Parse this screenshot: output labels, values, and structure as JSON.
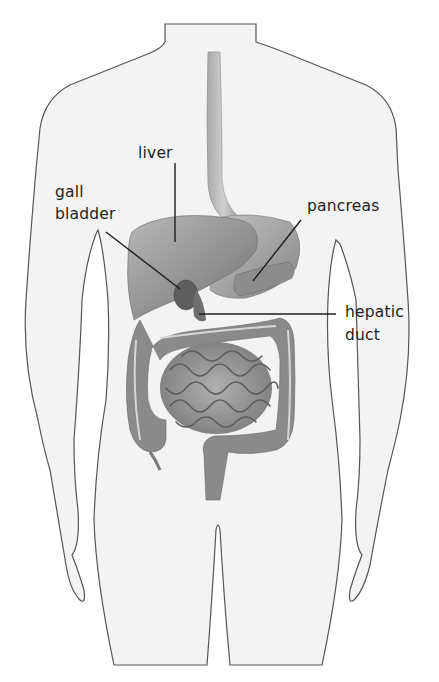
{
  "diagram": {
    "colors": {
      "background": "#ffffff",
      "body_fill": "#f3f3f3",
      "body_outline": "#555555",
      "organ_dark": "#6a6a6a",
      "organ_mid": "#9a9a9a",
      "organ_light": "#c4c4c4",
      "leader_line": "#1e1e1e",
      "label_text": "#1e1e1e"
    },
    "labels": {
      "liver": {
        "text": "liver",
        "x": 138,
        "y": 144
      },
      "gall_bladder": {
        "line1": "gall",
        "line2": "bladder",
        "x": 55,
        "y": 183
      },
      "pancreas": {
        "text": "pancreas",
        "x": 307,
        "y": 197
      },
      "hepatic_duct": {
        "line1": "hepatic",
        "line2": "duct",
        "x": 345,
        "y": 303
      }
    }
  }
}
